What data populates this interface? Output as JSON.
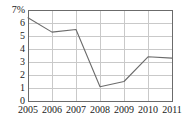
{
  "chart_data": {
    "type": "line",
    "title": "",
    "subtitle": "",
    "xlabel": "",
    "ylabel": "",
    "categories": [
      "2005",
      "2006",
      "2007",
      "2008",
      "2009",
      "2010",
      "2011"
    ],
    "x": [
      2005,
      2006,
      2007,
      2008,
      2009,
      2010,
      2011
    ],
    "values": [
      6.4,
      5.3,
      5.5,
      1.1,
      1.5,
      3.4,
      3.3
    ],
    "series": [
      {
        "name": "",
        "values": [
          6.4,
          5.3,
          5.5,
          1.1,
          1.5,
          3.4,
          3.3
        ]
      }
    ],
    "ylim": [
      0,
      7
    ],
    "xlim": [
      2005,
      2011
    ],
    "y_ticks": [
      0,
      1,
      2,
      3,
      4,
      5,
      6,
      7
    ],
    "y_tick_labels": [
      "0",
      "1",
      "2",
      "3",
      "4",
      "5",
      "6",
      "7%"
    ],
    "x_tick_labels": [
      "2005",
      "2006",
      "2007",
      "2008",
      "2009",
      "2010",
      "2011"
    ],
    "grid": true,
    "grid_axis": "both",
    "legend": false,
    "legend_position": "none",
    "unit": "%",
    "annotations": []
  },
  "style": {
    "line_color": "#6b6b6b",
    "grid_color": "#c9c9c9",
    "axis_color": "#6b6b6b",
    "text_color": "#1a1a1a",
    "background": "#ffffff"
  }
}
